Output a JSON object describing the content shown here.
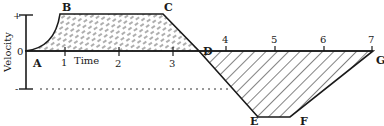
{
  "diagram": {
    "type": "velocity-time graph",
    "y_axis": {
      "label": "Velocity",
      "top_mark": "+",
      "zero_mark": "0",
      "bottom_mark": "-"
    },
    "x_axis": {
      "label": "Time",
      "ticks": [
        "1",
        "2",
        "3",
        "4",
        "5",
        "6",
        "7"
      ]
    },
    "points": [
      "A",
      "B",
      "C",
      "D",
      "E",
      "F",
      "G"
    ],
    "regions": [
      {
        "name": "positive-area",
        "pattern": "dash-cross-hatch",
        "bounded_by": "A-B-C-D"
      },
      {
        "name": "negative-area",
        "pattern": "diagonal-hatch",
        "bounded_by": "D-E-F-G"
      }
    ],
    "colors": {
      "line": "#1a1a1a",
      "background": "#ffffff"
    }
  }
}
